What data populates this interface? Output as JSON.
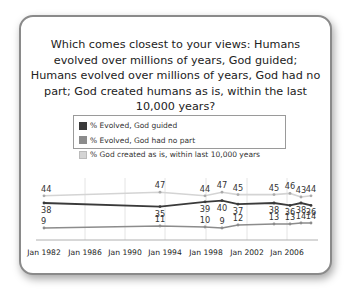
{
  "title": "Which comes closest to your views: Humans evolved over millions of years, God guided; Humans evolved over millions of years, God had no part; God created humans as is, within the last 10,000 years?",
  "legend": [
    {
      "label": "% Evolved, God guided",
      "color": "#3a3a3a"
    },
    {
      "label": "% Evolved, God had no part",
      "color": "#8c8c8c"
    },
    {
      "label": "% God created as is, within last 10,000 years",
      "color": "#d4d4d4"
    }
  ],
  "chart_data": {
    "type": "line",
    "title": "Which comes closest to your views: Humans evolved over millions of years, God guided; Humans evolved over millions of years, God had no part; God created humans as is, within the last 10,000 years?",
    "xlabel": "",
    "ylabel": "",
    "x_ticks": [
      "Jan 1982",
      "Jan 1986",
      "Jan 1990",
      "Jan 1994",
      "Jan 1998",
      "Jan 2002",
      "Jan 2006"
    ],
    "x": [
      "1982",
      "1993",
      "1997",
      "1999",
      "2001",
      "2004",
      "2005",
      "2006",
      "2007"
    ],
    "series": [
      {
        "name": "% Evolved, God guided",
        "color": "#3a3a3a",
        "values": [
          38,
          35,
          39,
          40,
          37,
          38,
          36,
          38,
          36
        ]
      },
      {
        "name": "% Evolved, God had no part",
        "color": "#8c8c8c",
        "values": [
          9,
          11,
          10,
          9,
          12,
          13,
          13,
          14,
          14
        ]
      },
      {
        "name": "% God created as is, within last 10,000 years",
        "color": "#d4d4d4",
        "values": [
          44,
          47,
          44,
          47,
          45,
          45,
          46,
          43,
          44
        ]
      }
    ],
    "grid": true,
    "legend_position": "top"
  }
}
